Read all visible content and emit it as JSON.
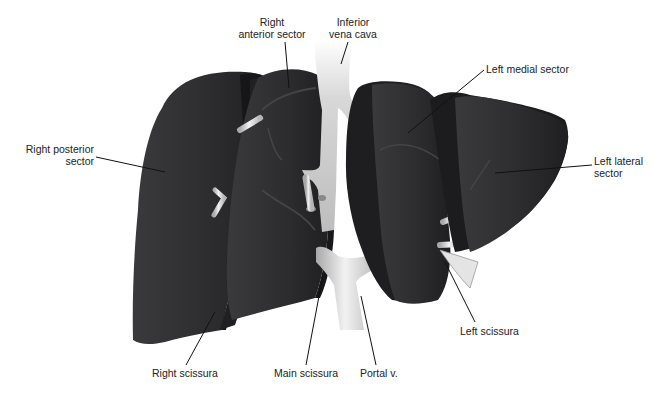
{
  "figure": {
    "colors": {
      "parenchyma": "#2e2e30",
      "parenchyma_dark": "#1c1c1e",
      "parenchyma_light": "#4a4a4d",
      "vessel": "#c9c9c9",
      "vessel_highlight": "#f2f2f2",
      "leader_line": "#111111",
      "text": "#222222",
      "background": "#ffffff"
    },
    "labels": {
      "right_anterior_sector": [
        "Right",
        "anterior sector"
      ],
      "inferior_vena_cava": [
        "Inferior",
        "vena cava"
      ],
      "left_medial_sector": [
        "Left medial sector"
      ],
      "right_posterior_sector": [
        "Right posterior",
        "sector"
      ],
      "left_lateral_sector": [
        "Left lateral",
        "sector"
      ],
      "left_scissura": [
        "Left scissura"
      ],
      "right_scissura": [
        "Right scissura"
      ],
      "main_scissura": [
        "Main scissura"
      ],
      "portal_vein": [
        "Portal v."
      ]
    }
  }
}
